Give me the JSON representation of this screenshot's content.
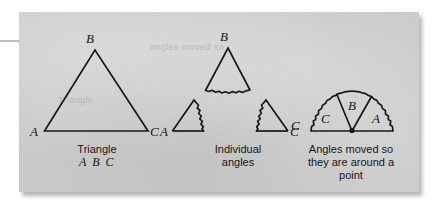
{
  "figure": {
    "background_color": "#ffffff",
    "plate_color": "#c9c9c9",
    "ink_color": "#18181a",
    "ghost_text_line1": "angles moved so",
    "ghost_text_line2": "Triangle"
  },
  "panels": {
    "left": {
      "name": "triangle",
      "caption_line1": "Triangle",
      "caption_line2": "A B C",
      "vertex_labels": {
        "apex": "B",
        "bottom_left": "A",
        "bottom_right": "C"
      }
    },
    "middle": {
      "name": "individual-angles",
      "caption_line1": "Individual",
      "caption_line2": "angles",
      "vertex_labels": {
        "apex": "B",
        "bottom_left": "A",
        "bottom_right": "C"
      }
    },
    "right": {
      "name": "angles-around-a-point",
      "caption_line1": "Angles moved so",
      "caption_line2": "they are around a",
      "caption_line3": "point",
      "sector_labels": {
        "left": "C",
        "middle": "B",
        "right": "A"
      }
    }
  }
}
